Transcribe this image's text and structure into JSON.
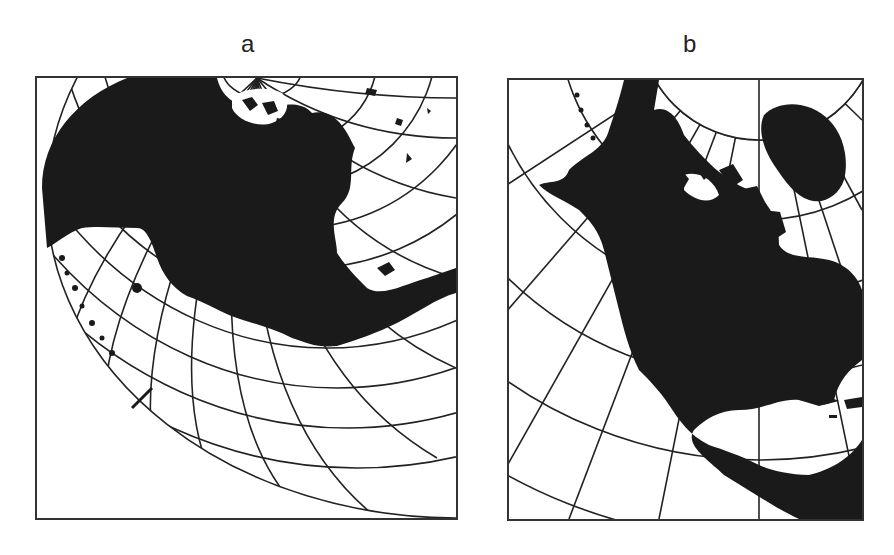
{
  "figure": {
    "panels": [
      {
        "id": "a",
        "label": "a",
        "description": "Oblique projection of North America centered far west; graticule curves toward lower right, land mass in black"
      },
      {
        "id": "b",
        "label": "b",
        "description": "Conic-style projection of North America with polar arc at top, meridians radiating from pole, land mass in black"
      }
    ]
  },
  "colors": {
    "land": "#1a1a1a",
    "water": "#ffffff",
    "graticule": "#222222",
    "frame": "#333333"
  }
}
